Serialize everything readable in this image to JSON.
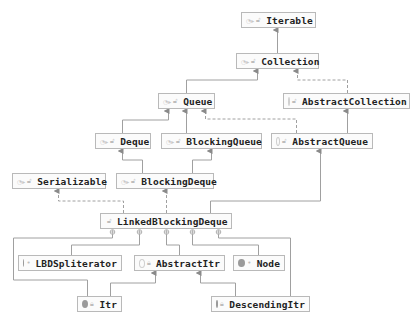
{
  "diagram": {
    "title": "",
    "nodes": {
      "iterable": {
        "label": "Iterable",
        "kind": "interface",
        "visibility": "public"
      },
      "collection": {
        "label": "Collection",
        "kind": "interface",
        "visibility": "public"
      },
      "queue": {
        "label": "Queue",
        "kind": "interface",
        "visibility": "public"
      },
      "abstract_collection": {
        "label": "AbstractCollection",
        "kind": "abstract-class",
        "visibility": "public"
      },
      "deque": {
        "label": "Deque",
        "kind": "interface",
        "visibility": "public"
      },
      "blocking_queue": {
        "label": "BlockingQueue",
        "kind": "interface",
        "visibility": "public"
      },
      "abstract_queue": {
        "label": "AbstractQueue",
        "kind": "abstract-class",
        "visibility": "public"
      },
      "serializable": {
        "label": "Serializable",
        "kind": "interface",
        "visibility": "public"
      },
      "blocking_deque": {
        "label": "BlockingDeque",
        "kind": "interface",
        "visibility": "public"
      },
      "linked_blocking_deque": {
        "label": "LinkedBlockingDeque",
        "kind": "class",
        "visibility": "public"
      },
      "lbd_spliterator": {
        "label": "LBDSpliterator",
        "kind": "class",
        "visibility": "package-private"
      },
      "abstract_itr": {
        "label": "AbstractItr",
        "kind": "abstract-class",
        "visibility": "private"
      },
      "node": {
        "label": "Node",
        "kind": "class",
        "visibility": "package-private"
      },
      "itr": {
        "label": "Itr",
        "kind": "class",
        "visibility": "private"
      },
      "descending_itr": {
        "label": "DescendingItr",
        "kind": "class",
        "visibility": "private"
      }
    },
    "edges": [
      {
        "from": "Collection",
        "to": "Iterable",
        "type": "extends"
      },
      {
        "from": "Queue",
        "to": "Collection",
        "type": "extends"
      },
      {
        "from": "AbstractCollection",
        "to": "Collection",
        "type": "implements"
      },
      {
        "from": "Deque",
        "to": "Queue",
        "type": "extends"
      },
      {
        "from": "BlockingQueue",
        "to": "Queue",
        "type": "extends"
      },
      {
        "from": "AbstractQueue",
        "to": "Queue",
        "type": "implements"
      },
      {
        "from": "AbstractQueue",
        "to": "AbstractCollection",
        "type": "extends"
      },
      {
        "from": "BlockingDeque",
        "to": "Deque",
        "type": "extends"
      },
      {
        "from": "BlockingDeque",
        "to": "BlockingQueue",
        "type": "extends"
      },
      {
        "from": "LinkedBlockingDeque",
        "to": "Serializable",
        "type": "implements"
      },
      {
        "from": "LinkedBlockingDeque",
        "to": "BlockingDeque",
        "type": "implements"
      },
      {
        "from": "LinkedBlockingDeque",
        "to": "AbstractQueue",
        "type": "extends"
      },
      {
        "from": "LinkedBlockingDeque",
        "to": "Itr",
        "type": "inner-class"
      },
      {
        "from": "LinkedBlockingDeque",
        "to": "LBDSpliterator",
        "type": "inner-class"
      },
      {
        "from": "LinkedBlockingDeque",
        "to": "AbstractItr",
        "type": "inner-class"
      },
      {
        "from": "LinkedBlockingDeque",
        "to": "Node",
        "type": "inner-class"
      },
      {
        "from": "LinkedBlockingDeque",
        "to": "DescendingItr",
        "type": "inner-class"
      },
      {
        "from": "Itr",
        "to": "AbstractItr",
        "type": "extends"
      },
      {
        "from": "DescendingItr",
        "to": "AbstractItr",
        "type": "extends"
      }
    ],
    "colors": {
      "line": "#9b9b9b",
      "border": "#b9b9b9",
      "text": "#222222",
      "background": "#ffffff"
    }
  }
}
